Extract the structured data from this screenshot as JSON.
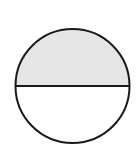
{
  "diagram": {
    "type": "circle-divided-horizontally",
    "canvas": {
      "width": 139,
      "height": 148,
      "background": "#ffffff"
    },
    "circle": {
      "cx": 72.5,
      "cy": 86,
      "r": 57,
      "stroke": "#1a1a1a",
      "stroke_width": 2
    },
    "regions": [
      {
        "name": "upper-half",
        "fill": "#e6e6e6",
        "shaded": true
      },
      {
        "name": "lower-half",
        "fill": "#ffffff",
        "shaded": false
      }
    ],
    "divider": {
      "orientation": "horizontal",
      "y": 86,
      "stroke": "#1a1a1a",
      "stroke_width": 2
    }
  }
}
